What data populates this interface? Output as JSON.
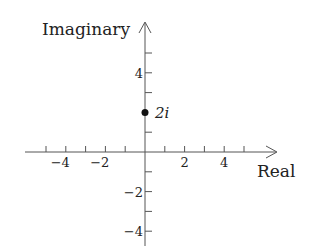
{
  "diagram": {
    "type": "complex-plane",
    "x_axis_title": "Real",
    "y_axis_title": "Imaginary",
    "x_tick_labels": [
      {
        "value": -4,
        "text": "−4"
      },
      {
        "value": -2,
        "text": "−2"
      },
      {
        "value": 2,
        "text": "2"
      },
      {
        "value": 4,
        "text": "4"
      }
    ],
    "y_tick_labels": [
      {
        "value": 4,
        "text": "4"
      },
      {
        "value": -2,
        "text": "−2"
      },
      {
        "value": -4,
        "text": "−4"
      }
    ],
    "x_ticks": [
      -5,
      -4,
      -3,
      -2,
      -1,
      1,
      2,
      3,
      4,
      5
    ],
    "y_ticks": [
      5,
      4,
      3,
      1,
      -1,
      -2,
      -3,
      -4
    ],
    "point": {
      "re": 0,
      "im": 2,
      "label": "2i"
    },
    "colors": {
      "axis": "#555555",
      "text": "#222222",
      "point": "#111111"
    }
  }
}
